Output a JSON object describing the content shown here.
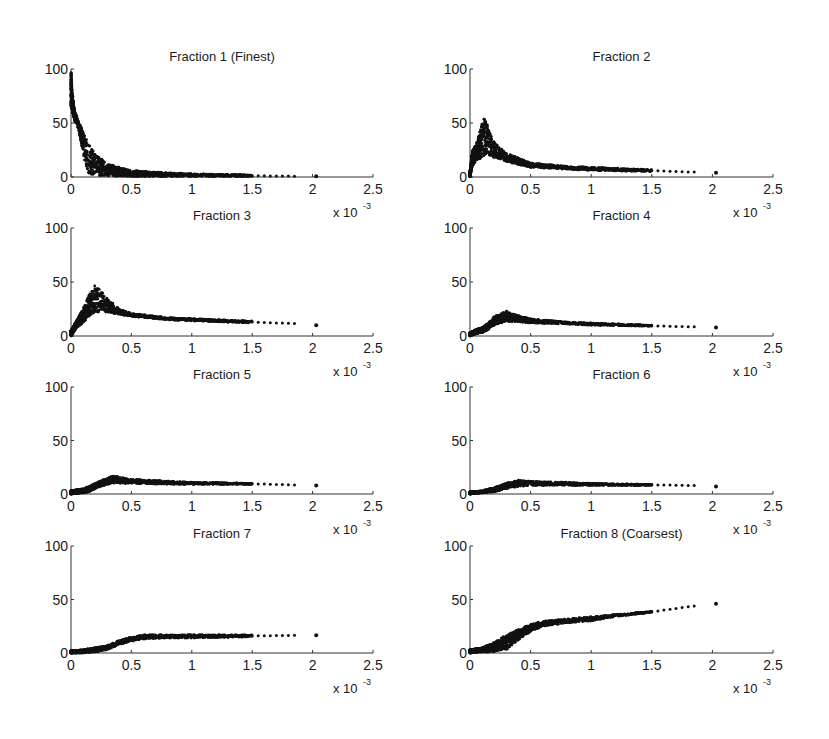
{
  "figure": {
    "rows": 4,
    "cols": 2,
    "marker_color": "#111111",
    "axis_color": "#333333"
  },
  "chart_data": [
    {
      "type": "scatter",
      "title": "Fraction 1 (Finest)",
      "xlabel": "",
      "ylabel": "",
      "xlim": [
        0,
        2.5
      ],
      "ylim": [
        0,
        100
      ],
      "xticks": [
        "0",
        "0.5",
        "1",
        "1.5",
        "2",
        "2.5"
      ],
      "yticks": [
        "0",
        "50",
        "100"
      ],
      "x_multiplier": "x 10^-3",
      "grid": false,
      "trend": {
        "x": [
          0,
          0.01,
          0.03,
          0.06,
          0.1,
          0.15,
          0.2,
          0.3,
          0.5,
          0.8,
          1.0,
          1.5,
          1.85,
          2.03
        ],
        "y_upper": [
          100,
          80,
          62,
          52,
          42,
          30,
          22,
          12,
          6,
          4,
          3,
          2,
          1,
          1
        ],
        "y_lower": [
          65,
          60,
          52,
          45,
          20,
          2,
          1,
          1,
          0.5,
          0.5,
          0.5,
          0.5,
          0.5,
          0.5
        ]
      }
    },
    {
      "type": "scatter",
      "title": "Fraction 2",
      "xlabel": "",
      "ylabel": "",
      "xlim": [
        0,
        2.5
      ],
      "ylim": [
        0,
        100
      ],
      "xticks": [
        "0",
        "0.5",
        "1",
        "1.5",
        "2",
        "2.5"
      ],
      "yticks": [
        "0",
        "50",
        "100"
      ],
      "x_multiplier": "x 10^-3",
      "grid": false,
      "trend": {
        "x": [
          0,
          0.02,
          0.05,
          0.1,
          0.12,
          0.15,
          0.2,
          0.3,
          0.5,
          0.8,
          1.0,
          1.5,
          1.85,
          2.03
        ],
        "y_upper": [
          5,
          25,
          30,
          50,
          60,
          45,
          32,
          22,
          13,
          10,
          9,
          7,
          5,
          4
        ],
        "y_lower": [
          0,
          10,
          15,
          18,
          20,
          20,
          18,
          14,
          9,
          7,
          6,
          5,
          4,
          4
        ]
      }
    },
    {
      "type": "scatter",
      "title": "Fraction 3",
      "xlabel": "",
      "ylabel": "",
      "xlim": [
        0,
        2.5
      ],
      "ylim": [
        0,
        100
      ],
      "xticks": [
        "0",
        "0.5",
        "1",
        "1.5",
        "2",
        "2.5"
      ],
      "yticks": [
        "0",
        "50",
        "100"
      ],
      "x_multiplier": "x 10^-3",
      "grid": false,
      "trend": {
        "x": [
          0,
          0.05,
          0.1,
          0.15,
          0.2,
          0.3,
          0.4,
          0.5,
          0.8,
          1.0,
          1.5,
          1.85,
          2.03
        ],
        "y_upper": [
          5,
          15,
          25,
          38,
          48,
          35,
          25,
          21,
          17,
          16,
          14,
          12,
          10
        ],
        "y_lower": [
          0,
          8,
          12,
          18,
          22,
          22,
          20,
          18,
          15,
          14,
          12,
          11,
          10
        ]
      }
    },
    {
      "type": "scatter",
      "title": "Fraction 4",
      "xlabel": "",
      "ylabel": "",
      "xlim": [
        0,
        2.5
      ],
      "ylim": [
        0,
        100
      ],
      "xticks": [
        "0",
        "0.5",
        "1",
        "1.5",
        "2",
        "2.5"
      ],
      "yticks": [
        "0",
        "50",
        "100"
      ],
      "x_multiplier": "x 10^-3",
      "grid": false,
      "trend": {
        "x": [
          0,
          0.05,
          0.1,
          0.15,
          0.2,
          0.3,
          0.4,
          0.5,
          0.8,
          1.0,
          1.5,
          1.85,
          2.03
        ],
        "y_upper": [
          3,
          6,
          8,
          12,
          18,
          23,
          19,
          16,
          13,
          12,
          10,
          9,
          8
        ],
        "y_lower": [
          0,
          2,
          3,
          6,
          10,
          13,
          13,
          12,
          11,
          10,
          9,
          8,
          8
        ]
      }
    },
    {
      "type": "scatter",
      "title": "Fraction 5",
      "xlabel": "",
      "ylabel": "",
      "xlim": [
        0,
        2.5
      ],
      "ylim": [
        0,
        100
      ],
      "xticks": [
        "0",
        "0.5",
        "1",
        "1.5",
        "2",
        "2.5"
      ],
      "yticks": [
        "0",
        "50",
        "100"
      ],
      "x_multiplier": "x 10^-3",
      "grid": false,
      "trend": {
        "x": [
          0,
          0.1,
          0.15,
          0.2,
          0.3,
          0.35,
          0.4,
          0.5,
          0.8,
          1.0,
          1.5,
          1.85,
          2.03
        ],
        "y_upper": [
          3,
          5,
          7,
          10,
          15,
          17,
          16,
          14,
          12,
          11,
          10,
          9,
          8
        ],
        "y_lower": [
          0,
          1,
          2,
          5,
          9,
          10,
          10,
          10,
          9,
          9,
          9,
          8,
          8
        ]
      }
    },
    {
      "type": "scatter",
      "title": "Fraction 6",
      "xlabel": "",
      "ylabel": "",
      "xlim": [
        0,
        2.5
      ],
      "ylim": [
        0,
        100
      ],
      "xticks": [
        "0",
        "0.5",
        "1",
        "1.5",
        "2",
        "2.5"
      ],
      "yticks": [
        "0",
        "50",
        "100"
      ],
      "x_multiplier": "x 10^-3",
      "grid": false,
      "trend": {
        "x": [
          0,
          0.1,
          0.2,
          0.3,
          0.4,
          0.5,
          0.8,
          1.0,
          1.5,
          1.85,
          2.03
        ],
        "y_upper": [
          2,
          3,
          6,
          10,
          13,
          12,
          11,
          10,
          9,
          8,
          7
        ],
        "y_lower": [
          0,
          1,
          2,
          5,
          7,
          8,
          8,
          8,
          8,
          8,
          7
        ]
      }
    },
    {
      "type": "scatter",
      "title": "Fraction 7",
      "xlabel": "",
      "ylabel": "",
      "xlim": [
        0,
        2.5
      ],
      "ylim": [
        0,
        100
      ],
      "xticks": [
        "0",
        "0.5",
        "1",
        "1.5",
        "2",
        "2.5"
      ],
      "yticks": [
        "0",
        "50",
        "100"
      ],
      "x_multiplier": "x 10^-3",
      "grid": false,
      "trend": {
        "x": [
          0,
          0.1,
          0.2,
          0.3,
          0.4,
          0.5,
          0.6,
          0.8,
          1.0,
          1.5,
          1.85,
          2.03
        ],
        "y_upper": [
          2,
          3,
          5,
          7,
          12,
          15,
          17,
          17,
          17,
          17,
          17,
          17
        ],
        "y_lower": [
          0,
          0,
          1,
          3,
          8,
          11,
          13,
          14,
          14,
          15,
          16,
          16
        ]
      }
    },
    {
      "type": "scatter",
      "title": "Fraction 8 (Coarsest)",
      "xlabel": "",
      "ylabel": "",
      "xlim": [
        0,
        2.5
      ],
      "ylim": [
        0,
        100
      ],
      "xticks": [
        "0",
        "0.5",
        "1",
        "1.5",
        "2",
        "2.5"
      ],
      "yticks": [
        "0",
        "50",
        "100"
      ],
      "x_multiplier": "x 10^-3",
      "grid": false,
      "trend": {
        "x": [
          0,
          0.1,
          0.2,
          0.3,
          0.4,
          0.5,
          0.6,
          0.8,
          1.0,
          1.2,
          1.5,
          1.85,
          2.03
        ],
        "y_upper": [
          3,
          5,
          10,
          17,
          22,
          27,
          30,
          32,
          34,
          36,
          39,
          44,
          46
        ],
        "y_lower": [
          0,
          1,
          1,
          3,
          12,
          20,
          25,
          28,
          30,
          34,
          38,
          44,
          46
        ]
      }
    }
  ]
}
